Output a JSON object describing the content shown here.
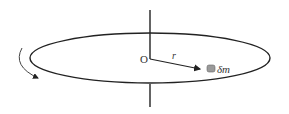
{
  "figure": {
    "origin_label": "O",
    "radius_label": "r",
    "mass_label": "δm",
    "colors": {
      "stroke": "#222222",
      "mass_fill": "#9a9a9a",
      "text": "#333333"
    }
  }
}
